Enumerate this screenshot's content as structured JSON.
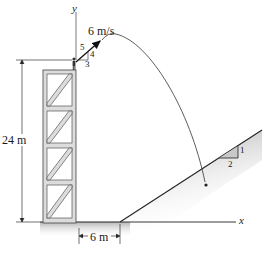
{
  "figure": {
    "type": "projectile-motion-diagram",
    "axes": {
      "x_label": "x",
      "y_label": "y"
    },
    "launch": {
      "speed_label": "6 m/s",
      "slope_triangle": {
        "hyp": "5",
        "rise": "4",
        "run": "3"
      }
    },
    "tower": {
      "height_label": "24 m",
      "panels": 4
    },
    "offset": {
      "label": "6 m"
    },
    "incline": {
      "slope_triangle": {
        "rise": "1",
        "run": "2"
      }
    }
  },
  "colors": {
    "line": "#222222",
    "shade": "#bdbdbd",
    "tower_fill": "#d9d9d9"
  }
}
